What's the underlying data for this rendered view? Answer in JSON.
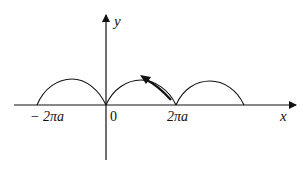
{
  "diagram": {
    "type": "cycloid",
    "axes": {
      "x_label": "x",
      "y_label": "y",
      "origin_label": "0"
    },
    "tick_labels": [
      {
        "id": "neg-2pi-a",
        "text": "− 2πa"
      },
      {
        "id": "pos-2pi-a",
        "text": "2πa"
      }
    ],
    "arches": [
      {
        "from": "-2πa",
        "to": "0"
      },
      {
        "from": "0",
        "to": "2πa"
      },
      {
        "from": "2πa",
        "to": "4πa"
      }
    ],
    "direction_arrow": {
      "on_arch": 1,
      "direction": "from 2πa toward peak (leftward)"
    },
    "colors": {
      "stroke": "#111111",
      "background": "#ffffff"
    }
  }
}
